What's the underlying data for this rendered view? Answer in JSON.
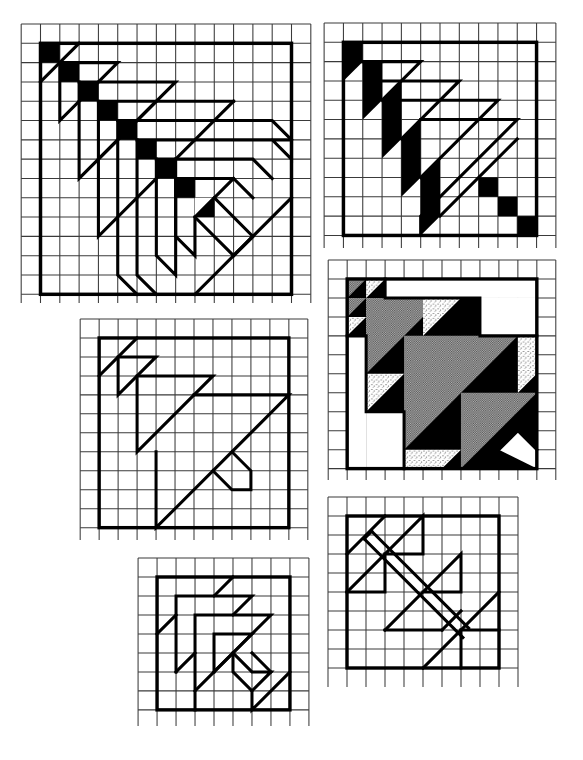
{
  "page": {
    "background": "#ffffff",
    "ink": "#000000",
    "shade_gray": "#8a8a8a",
    "cell_px": 19
  },
  "panels": [
    {
      "id": "panel-1",
      "name": "fan-of-triangles-large",
      "grid_cols": 15,
      "grid_rows": 14.5,
      "frame_cells": 13,
      "fill": "black squares on diagonal"
    },
    {
      "id": "panel-2",
      "name": "black-stripe-triangles",
      "grid_cols": 12,
      "grid_rows": 12,
      "frame_cells": 10,
      "fill": "black parallelograms + stepped squares"
    },
    {
      "id": "panel-3",
      "name": "shaded-maple-leaf",
      "grid_cols": 12,
      "grid_rows": 11.5,
      "frame_cells": 10,
      "fill": "gray, black, stippled"
    },
    {
      "id": "panel-4",
      "name": "outline-triangles",
      "grid_cols": 12,
      "grid_rows": 12,
      "frame_cells": 10,
      "fill": "outline only"
    },
    {
      "id": "panel-5",
      "name": "nested-corners",
      "grid_cols": 9,
      "grid_rows": 9,
      "frame_cells": 7,
      "fill": "outline only"
    },
    {
      "id": "panel-6",
      "name": "crossed-stem-triangles",
      "grid_cols": 10,
      "grid_rows": 10,
      "frame_cells": 8,
      "fill": "outline only"
    }
  ]
}
